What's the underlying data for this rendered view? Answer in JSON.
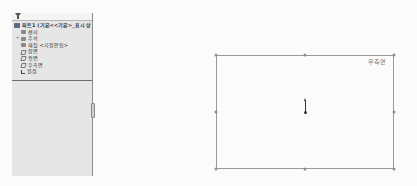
{
  "feature_manager": {
    "filter_icon": "funnel-icon",
    "root": {
      "label": "파트1 (기본<<기본>_표시 상",
      "icon": "part-icon"
    },
    "items": [
      {
        "label": "센서",
        "icon": "sensor-icon"
      },
      {
        "label": "주석",
        "icon": "annotation-icon",
        "expandable": true,
        "expand_glyph": "+"
      },
      {
        "label": "재질 <지정안됨>",
        "icon": "material-icon"
      },
      {
        "label": "정면",
        "icon": "plane-icon"
      },
      {
        "label": "윗면",
        "icon": "plane-icon"
      },
      {
        "label": "우측면",
        "icon": "plane-icon"
      },
      {
        "label": "원점",
        "icon": "origin-icon"
      }
    ]
  },
  "viewport": {
    "plane_label": "우측면",
    "colors": {
      "plane_border": "#9a9a9a",
      "background": "#fbfbfb",
      "panel": "#e6e6e6"
    }
  }
}
